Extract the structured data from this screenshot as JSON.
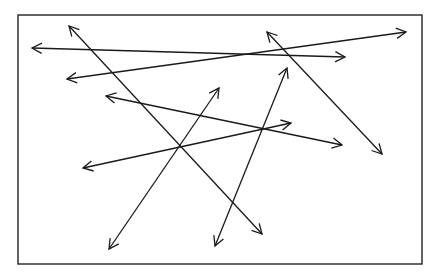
{
  "canvas": {
    "width": 439,
    "height": 279,
    "background": "#ffffff"
  },
  "frame": {
    "x": 18,
    "y": 15,
    "width": 404,
    "height": 249,
    "stroke": "#222222",
    "stroke_width": 1.4
  },
  "arrow_style": {
    "stroke": "#1a1a1a",
    "stroke_width": 1.3,
    "head_length": 11,
    "head_angle_deg": 28,
    "double_headed": true
  },
  "arrows": [
    {
      "id": "arrow-1",
      "x1": 32,
      "y1": 48,
      "x2": 345,
      "y2": 57
    },
    {
      "id": "arrow-2",
      "x1": 67,
      "y1": 79,
      "x2": 406,
      "y2": 32
    },
    {
      "id": "arrow-3",
      "x1": 69,
      "y1": 26,
      "x2": 262,
      "y2": 234
    },
    {
      "id": "arrow-4",
      "x1": 106,
      "y1": 96,
      "x2": 342,
      "y2": 145
    },
    {
      "id": "arrow-5",
      "x1": 83,
      "y1": 168,
      "x2": 291,
      "y2": 123
    },
    {
      "id": "arrow-6",
      "x1": 109,
      "y1": 249,
      "x2": 219,
      "y2": 88
    },
    {
      "id": "arrow-7",
      "x1": 215,
      "y1": 246,
      "x2": 287,
      "y2": 68
    },
    {
      "id": "arrow-8",
      "x1": 267,
      "y1": 32,
      "x2": 382,
      "y2": 154
    }
  ]
}
